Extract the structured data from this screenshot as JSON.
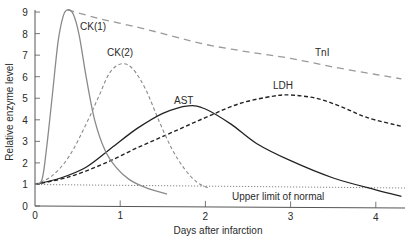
{
  "chart_data": {
    "type": "line",
    "title": "",
    "xlabel": "Days after infarction",
    "ylabel": "Relative enzyme level",
    "xlim": [
      0,
      4.3
    ],
    "ylim": [
      0,
      9
    ],
    "x_ticks": [
      0,
      1,
      2,
      3,
      4
    ],
    "y_ticks": [
      0,
      1,
      2,
      3,
      4,
      5,
      6,
      7,
      8,
      9
    ],
    "grid": false,
    "legend": "inline labels",
    "reference_line": {
      "name": "Upper limit of normal",
      "label": "Upper limit of normal",
      "value_start": 1.0,
      "value_end": 0.85,
      "style": "dotted"
    },
    "series": [
      {
        "name": "CK(1)",
        "label": "CK(1)",
        "style": "solid",
        "color": "#8a8a8a",
        "points": [
          [
            0,
            1.0
          ],
          [
            0.08,
            1.2
          ],
          [
            0.13,
            2.5
          ],
          [
            0.2,
            5.0
          ],
          [
            0.27,
            7.6
          ],
          [
            0.33,
            8.8
          ],
          [
            0.38,
            9.1
          ],
          [
            0.45,
            8.9
          ],
          [
            0.52,
            7.9
          ],
          [
            0.6,
            6.0
          ],
          [
            0.7,
            4.0
          ],
          [
            0.82,
            2.6
          ],
          [
            0.95,
            1.8
          ],
          [
            1.1,
            1.25
          ],
          [
            1.3,
            0.85
          ],
          [
            1.55,
            0.55
          ]
        ]
      },
      {
        "name": "CK(2)",
        "label": "CK(2)",
        "style": "dashed",
        "color": "#8a8a8a",
        "points": [
          [
            0,
            1.0
          ],
          [
            0.2,
            1.4
          ],
          [
            0.4,
            2.3
          ],
          [
            0.6,
            3.8
          ],
          [
            0.75,
            5.1
          ],
          [
            0.88,
            6.2
          ],
          [
            1.02,
            6.6
          ],
          [
            1.15,
            6.35
          ],
          [
            1.3,
            5.4
          ],
          [
            1.45,
            4.0
          ],
          [
            1.6,
            2.7
          ],
          [
            1.75,
            1.75
          ],
          [
            1.9,
            1.1
          ],
          [
            2.03,
            0.85
          ]
        ]
      },
      {
        "name": "TnI",
        "label": "TnI",
        "style": "long-dashed",
        "color": "#9a9a9a",
        "points": [
          [
            0.38,
            9.1
          ],
          [
            0.75,
            8.7
          ],
          [
            1.2,
            8.3
          ],
          [
            1.6,
            7.9
          ],
          [
            2.0,
            7.5
          ],
          [
            2.5,
            7.15
          ],
          [
            3.0,
            6.85
          ],
          [
            3.5,
            6.45
          ],
          [
            4.0,
            6.1
          ],
          [
            4.3,
            5.9
          ]
        ]
      },
      {
        "name": "AST",
        "label": "AST",
        "style": "solid",
        "color": "#1a1a1a",
        "points": [
          [
            0,
            1.0
          ],
          [
            0.3,
            1.3
          ],
          [
            0.6,
            1.8
          ],
          [
            0.9,
            2.7
          ],
          [
            1.2,
            3.6
          ],
          [
            1.5,
            4.3
          ],
          [
            1.8,
            4.65
          ],
          [
            2.0,
            4.5
          ],
          [
            2.3,
            3.8
          ],
          [
            2.6,
            2.9
          ],
          [
            3.0,
            2.1
          ],
          [
            3.5,
            1.3
          ],
          [
            4.0,
            0.75
          ],
          [
            4.3,
            0.45
          ]
        ]
      },
      {
        "name": "LDH",
        "label": "LDH",
        "style": "dashed",
        "color": "#1a1a1a",
        "points": [
          [
            0,
            1.0
          ],
          [
            0.4,
            1.35
          ],
          [
            0.8,
            1.95
          ],
          [
            1.2,
            2.7
          ],
          [
            1.6,
            3.4
          ],
          [
            2.0,
            4.1
          ],
          [
            2.4,
            4.75
          ],
          [
            2.8,
            5.1
          ],
          [
            3.0,
            5.15
          ],
          [
            3.3,
            5.0
          ],
          [
            3.6,
            4.6
          ],
          [
            3.9,
            4.1
          ],
          [
            4.3,
            3.7
          ]
        ]
      }
    ]
  },
  "labels": {
    "ck1": "CK(1)",
    "ck2": "CK(2)",
    "tni": "TnI",
    "ast": "AST",
    "ldh": "LDH",
    "uln": "Upper limit of normal",
    "xlabel": "Days after infarction",
    "ylabel": "Relative enzyme level",
    "xticks": [
      "0",
      "1",
      "2",
      "3",
      "4"
    ],
    "yticks": [
      "0",
      "1",
      "2",
      "3",
      "4",
      "5",
      "6",
      "7",
      "8",
      "9"
    ]
  }
}
